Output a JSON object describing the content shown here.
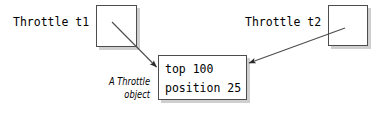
{
  "diagram": {
    "background_color": "#ffffff",
    "line_color": "#4d4d4d",
    "shadow_color": "#cfcfcf",
    "text_color": "#000000",
    "references": [
      {
        "label": "Throttle t1",
        "box_name": "reference-box-t1"
      },
      {
        "label": "Throttle t2",
        "box_name": "reference-box-t2"
      }
    ],
    "object": {
      "caption_line1": "A Throttle",
      "caption_line2": "object",
      "fields": [
        {
          "text": "top 100"
        },
        {
          "text": "position 25"
        }
      ]
    },
    "arrows": [
      {
        "name": "arrow-t1-to-object",
        "from": "reference-box-t1",
        "to": "object-box"
      },
      {
        "name": "arrow-t2-to-object",
        "from": "reference-box-t2",
        "to": "object-box"
      }
    ]
  }
}
